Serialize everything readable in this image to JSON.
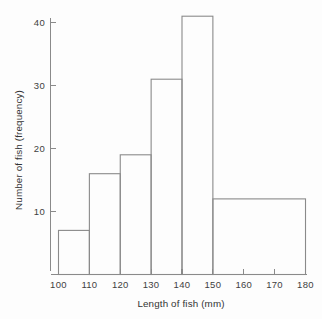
{
  "chart_data": {
    "type": "bar",
    "title": "",
    "xlabel": "Length of fish (mm)",
    "ylabel": "Number of fish (frequency)",
    "xlim": [
      100,
      180
    ],
    "ylim": [
      0,
      43
    ],
    "grid": false,
    "legend": "none",
    "histogram": true,
    "bin_edges": [
      100,
      110,
      120,
      130,
      140,
      150,
      180
    ],
    "categories": [
      "100-110",
      "110-120",
      "120-130",
      "130-140",
      "140-150",
      "150-180"
    ],
    "values": [
      7,
      16,
      19,
      31,
      41,
      12
    ],
    "xticks": [
      100,
      110,
      120,
      130,
      140,
      150,
      160,
      170,
      180
    ],
    "xtick_labels": [
      "100",
      "110",
      "120",
      "130",
      "140",
      "150",
      "160",
      "170",
      "180"
    ],
    "yticks": [
      10,
      20,
      30,
      40
    ],
    "ytick_labels": [
      "10",
      "20",
      "30",
      "40"
    ],
    "bars": [
      {
        "name": "bin-100-110",
        "x0": 100,
        "x1": 110,
        "value": 7
      },
      {
        "name": "bin-110-120",
        "x0": 110,
        "x1": 120,
        "value": 16
      },
      {
        "name": "bin-120-130",
        "x0": 120,
        "x1": 130,
        "value": 19
      },
      {
        "name": "bin-130-140",
        "x0": 130,
        "x1": 140,
        "value": 31
      },
      {
        "name": "bin-140-150",
        "x0": 140,
        "x1": 150,
        "value": 41
      },
      {
        "name": "bin-150-180",
        "x0": 150,
        "x1": 180,
        "value": 12
      }
    ],
    "colors": {
      "background": "#fdfdfd",
      "axis": "#8a8a8a",
      "bar_stroke": "#8a8a8a",
      "bar_fill": "none",
      "text": "#3a3a3a"
    }
  }
}
